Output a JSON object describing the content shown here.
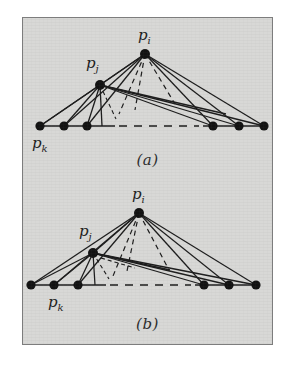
{
  "figure": {
    "background_color": "#d8d8d6",
    "frame_border_color": "#7d7d7d",
    "ink_color": "#1c1c1c",
    "panels": [
      {
        "id": "panel-a",
        "caption": "(a)",
        "labels": {
          "apex": "p_i",
          "middle": "p_j",
          "baseline_left": "p_k"
        },
        "label_text": {
          "apex_base": "p",
          "apex_sub": "i",
          "middle_base": "p",
          "middle_sub": "j",
          "left_base": "p",
          "left_sub": "k"
        },
        "geometry": {
          "apex": [
            144,
            53
          ],
          "middle": [
            99,
            84
          ],
          "baseline_y": 126,
          "left_nodes_x": [
            39,
            63,
            86
          ],
          "right_nodes_x": [
            212,
            238,
            263
          ],
          "dashed_gap": [
            112,
            195
          ]
        }
      },
      {
        "id": "panel-b",
        "caption": "(b)",
        "labels": {
          "apex": "p_i",
          "middle": "p_j",
          "baseline_left": "p_k"
        },
        "label_text": {
          "apex_base": "p",
          "apex_sub": "i",
          "middle_base": "p",
          "middle_sub": "j",
          "left_base": "p",
          "left_sub": "k"
        },
        "geometry": {
          "apex": [
            138,
            212
          ],
          "middle": [
            92,
            252
          ],
          "baseline_y": 284,
          "left_nodes_x": [
            31,
            53,
            77
          ],
          "right_nodes_x": [
            203,
            228,
            255
          ],
          "dashed_gap": [
            100,
            185
          ]
        }
      }
    ]
  }
}
